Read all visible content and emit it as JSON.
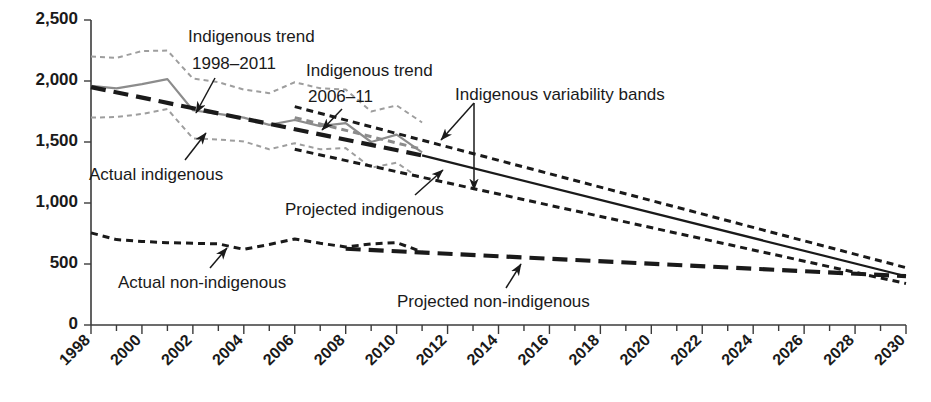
{
  "chart_data": {
    "type": "line",
    "title": "",
    "xlabel": "",
    "ylabel": "",
    "xlim": [
      1998,
      2030
    ],
    "ylim": [
      0,
      2500
    ],
    "grid": false,
    "legend_position": "none (inline annotations with leader arrows)",
    "y_ticks": [
      "0",
      "500",
      "1,000",
      "1,500",
      "2,000",
      "2,500"
    ],
    "y_tick_values": [
      0,
      500,
      1000,
      1500,
      2000,
      2500
    ],
    "x_ticks": [
      "1998",
      "2000",
      "2002",
      "2004",
      "2006",
      "2008",
      "2010",
      "2012",
      "2014",
      "2016",
      "2018",
      "2020",
      "2022",
      "2024",
      "2026",
      "2028",
      "2030"
    ],
    "x_tick_values": [
      1998,
      2000,
      2002,
      2004,
      2006,
      2008,
      2010,
      2012,
      2014,
      2016,
      2018,
      2020,
      2022,
      2024,
      2026,
      2028,
      2030
    ],
    "x_minor_tick_values": [
      1999,
      2001,
      2003,
      2005,
      2007,
      2009,
      2011,
      2013,
      2015,
      2017,
      2019,
      2021,
      2023,
      2025,
      2027,
      2029
    ],
    "series": [
      {
        "name": "Actual indigenous",
        "style": "solid",
        "color": "#8c8c8c",
        "x": [
          1998,
          1999,
          2000,
          2001,
          2002,
          2003,
          2004,
          2005,
          2006,
          2007,
          2008,
          2009,
          2010,
          2011
        ],
        "values": [
          1960,
          1940,
          1975,
          2015,
          1760,
          1730,
          1700,
          1640,
          1680,
          1630,
          1655,
          1500,
          1560,
          1415
        ]
      },
      {
        "name": "Indigenous trend 1998-2011",
        "style": "long-dash",
        "color": "#1a1a1a",
        "x": [
          1998,
          2011
        ],
        "values": [
          1950,
          1390
        ]
      },
      {
        "name": "Indigenous trend 2006-11",
        "style": "dash",
        "color": "#8c8c8c",
        "x": [
          2006,
          2011
        ],
        "values": [
          1700,
          1440
        ]
      },
      {
        "name": "Projected indigenous",
        "style": "solid",
        "color": "#1a1a1a",
        "x": [
          2011,
          2030
        ],
        "values": [
          1390,
          400
        ]
      },
      {
        "name": "Indigenous variability band upper (historical)",
        "style": "dot-dash",
        "color": "#9e9e9e",
        "x": [
          1998,
          1999,
          2000,
          2001,
          2002,
          2003,
          2004,
          2005,
          2006,
          2007,
          2008,
          2009,
          2010,
          2011
        ],
        "values": [
          2200,
          2190,
          2245,
          2250,
          2020,
          1990,
          1930,
          1900,
          1990,
          1940,
          1930,
          1750,
          1800,
          1660
        ]
      },
      {
        "name": "Indigenous variability band lower (historical)",
        "style": "dot-dash",
        "color": "#9e9e9e",
        "x": [
          1998,
          1999,
          2000,
          2001,
          2002,
          2003,
          2004,
          2005,
          2006,
          2007,
          2008,
          2009,
          2010,
          2011
        ],
        "values": [
          1700,
          1705,
          1730,
          1770,
          1530,
          1520,
          1505,
          1440,
          1490,
          1440,
          1450,
          1290,
          1330,
          1190
        ]
      },
      {
        "name": "Indigenous variability band upper (projected)",
        "style": "dash",
        "color": "#1a1a1a",
        "x": [
          2006,
          2030
        ],
        "values": [
          1790,
          470
        ]
      },
      {
        "name": "Indigenous variability band lower (projected)",
        "style": "dash",
        "color": "#1a1a1a",
        "x": [
          2006,
          2030
        ],
        "values": [
          1440,
          340
        ]
      },
      {
        "name": "Actual non-indigenous",
        "style": "dash",
        "color": "#1a1a1a",
        "x": [
          1998,
          1999,
          2000,
          2001,
          2002,
          2003,
          2004,
          2005,
          2006,
          2007,
          2008,
          2009,
          2010,
          2011
        ],
        "values": [
          755,
          700,
          685,
          675,
          670,
          665,
          620,
          660,
          705,
          670,
          640,
          665,
          675,
          600
        ]
      },
      {
        "name": "Projected non-indigenous",
        "style": "long-dash",
        "color": "#1a1a1a",
        "x": [
          2008,
          2030
        ],
        "values": [
          625,
          400
        ]
      }
    ],
    "annotations": [
      {
        "id": "indigenous-trend-1998-2011",
        "line1": "Indigenous trend",
        "line2": "1998–2011"
      },
      {
        "id": "indigenous-trend-2006-11",
        "line1": "Indigenous trend",
        "line2": "2006–11"
      },
      {
        "id": "indigenous-variability-bands",
        "line1": "Indigenous variability bands",
        "line2": ""
      },
      {
        "id": "actual-indigenous",
        "line1": "Actual indigenous",
        "line2": ""
      },
      {
        "id": "projected-indigenous",
        "line1": "Projected indigenous",
        "line2": ""
      },
      {
        "id": "actual-non-indigenous",
        "line1": "Actual non-indigenous",
        "line2": ""
      },
      {
        "id": "projected-non-indigenous",
        "line1": "Projected non-indigenous",
        "line2": ""
      }
    ]
  },
  "axes": {
    "y_tick_labels": [
      "2,500",
      "2,000",
      "1,500",
      "1,000",
      "500",
      "0"
    ],
    "x_tick_labels": [
      "1998",
      "2000",
      "2002",
      "2004",
      "2006",
      "2008",
      "2010",
      "2012",
      "2014",
      "2016",
      "2018",
      "2020",
      "2022",
      "2024",
      "2026",
      "2028",
      "2030"
    ]
  },
  "annotations": {
    "indigenous_trend_1998_2011_l1": "Indigenous trend",
    "indigenous_trend_1998_2011_l2": "1998–2011",
    "indigenous_trend_2006_11_l1": "Indigenous trend",
    "indigenous_trend_2006_11_l2": "2006–11",
    "indigenous_variability_bands": "Indigenous variability bands",
    "actual_indigenous": "Actual indigenous",
    "projected_indigenous": "Projected indigenous",
    "actual_non_indigenous": "Actual non-indigenous",
    "projected_non_indigenous": "Projected non-indigenous"
  },
  "colors": {
    "gray_series": "#8c8c8c",
    "gray_band": "#9e9e9e",
    "black_series": "#1a1a1a",
    "axis": "#3b3b3b",
    "background": "#ffffff"
  }
}
